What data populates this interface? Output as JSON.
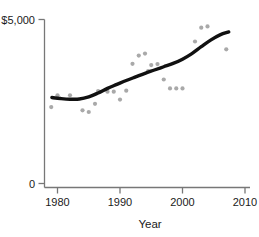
{
  "chart_data": {
    "type": "scatter",
    "title": "",
    "subtitle": "",
    "xlabel": "Year",
    "ylabel": "",
    "xlim": [
      1978.5,
      2010.8
    ],
    "ylim": [
      0,
      5450
    ],
    "grid": false,
    "legend": null,
    "x_ticks": [
      1980,
      1990,
      2000,
      2010
    ],
    "x_tick_labels": [
      "1980",
      "1990",
      "2000",
      "2010"
    ],
    "y_ticks": [
      0,
      5000
    ],
    "y_tick_labels": [
      "0",
      "$5,000"
    ],
    "annotations": [],
    "colors": {
      "point": "#a9a9a9",
      "trend_line": "#111111",
      "axis": "#777777",
      "text": "#1a1a1a",
      "background": "#ffffff"
    },
    "marker": {
      "shape": "circle",
      "size_px": 4.2,
      "color": "#a9a9a9"
    },
    "series": [
      {
        "name": "Observations",
        "type": "scatter",
        "x": [
          1979,
          1980,
          1982,
          1984,
          1985,
          1986,
          1986.5,
          1988,
          1989,
          1990,
          1991,
          1992,
          1993,
          1994,
          1994.5,
          1995,
          1996,
          1997,
          1998,
          1999,
          2000,
          2002,
          2003,
          2004,
          2007
        ],
        "values": [
          2330,
          2690,
          2690,
          2230,
          2180,
          2430,
          2820,
          2800,
          2800,
          2560,
          2830,
          3650,
          3900,
          3960,
          3430,
          3610,
          3640,
          3170,
          2900,
          2900,
          2900,
          4330,
          4750,
          4790,
          4090
        ]
      },
      {
        "name": "Trend (smoothed)",
        "type": "line",
        "x": [
          1979.1,
          1980.5,
          1982,
          1983.5,
          1985,
          1986.5,
          1988,
          1989.5,
          1991,
          1992.5,
          1994,
          1995.5,
          1997,
          1998.5,
          2000,
          2001.5,
          2003,
          2004.5,
          2006,
          2007.4
        ],
        "values": [
          2620,
          2590,
          2570,
          2575,
          2640,
          2760,
          2900,
          3020,
          3140,
          3250,
          3360,
          3460,
          3560,
          3660,
          3790,
          3960,
          4170,
          4370,
          4530,
          4620
        ]
      }
    ]
  }
}
